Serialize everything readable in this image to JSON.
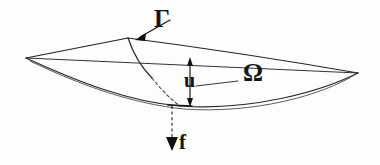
{
  "figure": {
    "background_color": "#fdfdfb",
    "ink_color": "#1c1c1c",
    "labels": {
      "boundary": "Γ",
      "domain": "Ω",
      "displacement": "u",
      "force": "f"
    },
    "label_meanings": {
      "boundary": "boundary-curve-gamma",
      "domain": "domain-omega",
      "displacement": "vertical-displacement-u",
      "force": "applied-load-f"
    },
    "geometry": {
      "vertex_left": [
        26,
        58
      ],
      "vertex_top": [
        128,
        38
      ],
      "vertex_right": [
        358,
        73
      ],
      "sag_point": [
        178,
        105
      ],
      "undeformed_midline": [
        [
          26,
          58
        ],
        [
          358,
          73
        ]
      ],
      "gamma_curve_start": [
        128,
        38
      ],
      "gamma_curve_end": [
        180,
        106
      ],
      "u_arrow_x": 190,
      "u_arrow_top_y": 60,
      "u_arrow_bottom_y": 104,
      "f_arrow_x": 172,
      "f_arrow_top_y": 104,
      "f_arrow_tip_y": 150,
      "gamma_pointer_from": [
        170,
        20
      ],
      "gamma_pointer_to": [
        137,
        39
      ],
      "omega_leader_from": [
        236,
        80
      ],
      "omega_leader_to": [
        196,
        85
      ]
    }
  }
}
